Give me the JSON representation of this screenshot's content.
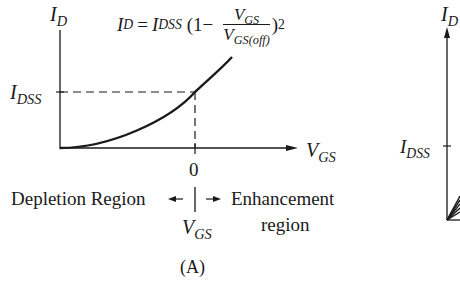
{
  "panel_a": {
    "y_axis_label_main": "I",
    "y_axis_label_sub": "D",
    "x_axis_label_main": "V",
    "x_axis_label_sub": "GS",
    "idss_label_main": "I",
    "idss_label_sub": "DSS",
    "zero_tick": "0",
    "equation": {
      "lhs_main": "I",
      "lhs_sub": "D",
      "equals": "=",
      "coef_main": "I",
      "coef_sub": "DSS",
      "open": "(1−",
      "num_main": "V",
      "num_sub": "GS",
      "den_main": "V",
      "den_sub": "GS(off)",
      "close": ")",
      "exponent": "2"
    },
    "depletion_label": "Depletion Region",
    "enhancement_label_line1": "Enhancement",
    "enhancement_label_line2": "region",
    "divider_label_main": "V",
    "divider_label_sub": "GS",
    "caption": "(A)"
  },
  "panel_b_partial": {
    "y_axis_label_main": "I",
    "y_axis_label_sub": "D",
    "idss_label_main": "I",
    "idss_label_sub": "DSS"
  },
  "colors": {
    "ink": "#1a1a1a",
    "background": "#ffffff"
  }
}
